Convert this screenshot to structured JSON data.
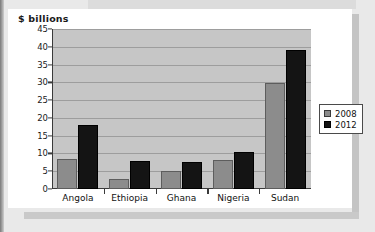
{
  "chart_data": {
    "type": "bar",
    "title": "$ billions",
    "xlabel": "",
    "ylabel": "",
    "ylim": [
      0,
      45
    ],
    "ytick_step": 5,
    "yticks": [
      45,
      40,
      35,
      30,
      25,
      20,
      15,
      10,
      5,
      0
    ],
    "grid": true,
    "legend_position": "right",
    "categories": [
      "Angola",
      "Ethiopia",
      "Ghana",
      "Nigeria",
      "Sudan"
    ],
    "series": [
      {
        "name": "2008",
        "color": "#8c8c8c",
        "values": [
          8.5,
          2.7,
          5.0,
          8.2,
          29.8
        ]
      },
      {
        "name": "2012",
        "color": "#141414",
        "values": [
          18.0,
          8.0,
          7.5,
          10.5,
          39.0
        ]
      }
    ]
  },
  "legend": {
    "items": [
      {
        "label": "2008",
        "swatch": "gray-square-swatch"
      },
      {
        "label": "2012",
        "swatch": "black-square-swatch"
      }
    ]
  }
}
